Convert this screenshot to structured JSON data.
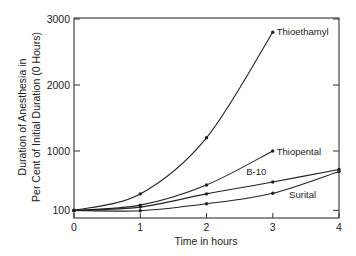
{
  "chart_data": {
    "type": "line",
    "title": "",
    "xlabel": "Time in hours",
    "ylabel_line1": "Duration of Anesthesia in",
    "ylabel_line2": "Per Cent of Initial Duration (0 Hours)",
    "xlim": [
      0,
      4
    ],
    "ylim": [
      0,
      3000
    ],
    "x_ticks": [
      0,
      1,
      2,
      3,
      4
    ],
    "x_tick_labels": [
      "0",
      "1",
      "2",
      "3",
      "4"
    ],
    "y_ticks": [
      100,
      1000,
      2000,
      3000
    ],
    "y_tick_labels": [
      "100",
      "1000",
      "2000",
      "3000"
    ],
    "grid": false,
    "legend": "inline labels at curve ends",
    "series": [
      {
        "name": "Thioethamyl",
        "x": [
          0,
          1,
          2,
          3
        ],
        "values": [
          100,
          350,
          1200,
          2800
        ]
      },
      {
        "name": "Thiopental",
        "x": [
          0,
          1,
          2,
          3
        ],
        "values": [
          100,
          180,
          485,
          1000
        ]
      },
      {
        "name": "B-10",
        "x": [
          0,
          1,
          2,
          3,
          4
        ],
        "values": [
          100,
          150,
          350,
          530,
          720
        ]
      },
      {
        "name": "Surital",
        "x": [
          0,
          1,
          2,
          3,
          4
        ],
        "values": [
          100,
          95,
          200,
          360,
          690
        ]
      }
    ]
  },
  "colors": {
    "line": "#222222",
    "axis": "#333333",
    "background": "#ffffff"
  }
}
